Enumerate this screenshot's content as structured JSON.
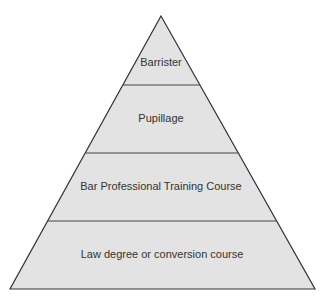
{
  "diagram": {
    "type": "pyramid",
    "colors": {
      "fill": "#e3e3e3",
      "stroke": "#333333",
      "text": "#333333",
      "background": "#ffffff"
    },
    "levels": [
      {
        "label": "Barrister"
      },
      {
        "label": "Pupillage"
      },
      {
        "label": "Bar Professional Training Course"
      },
      {
        "label": "Law degree or conversion course"
      }
    ]
  }
}
